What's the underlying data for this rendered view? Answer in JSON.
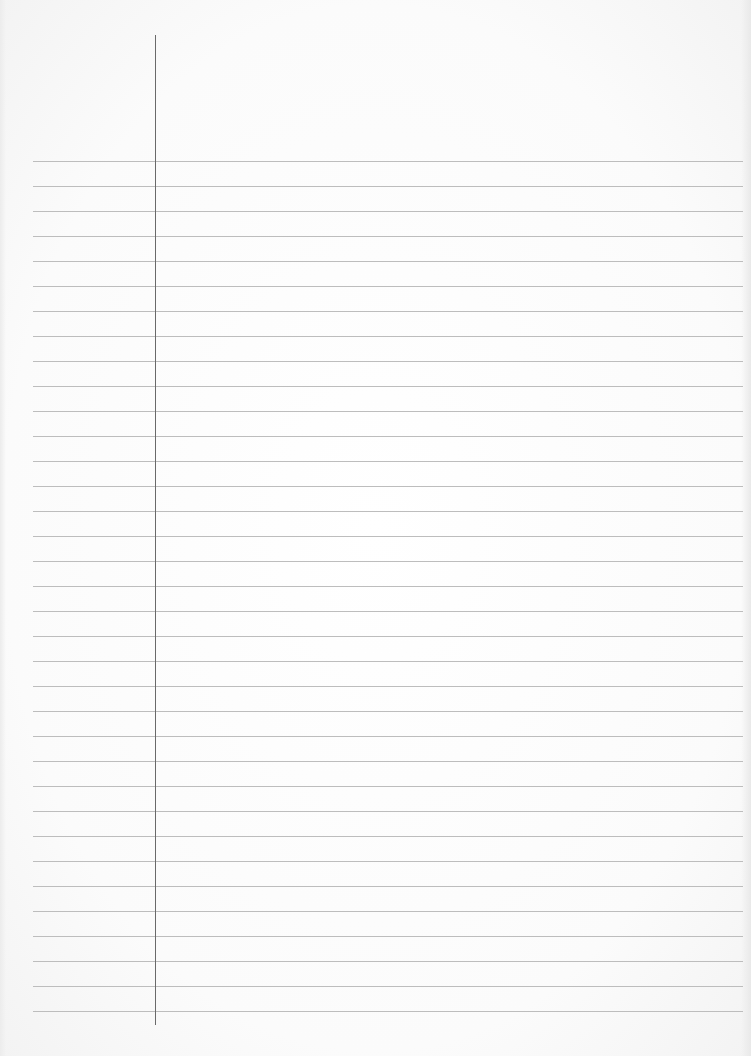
{
  "page": {
    "type": "ruled-notebook-page",
    "content_text": "",
    "background_color": "#fdfdfd",
    "rule_color": "#bdbdbd",
    "margin_line_color": "#6a6a6a",
    "rules": {
      "count": 35,
      "first_y": 161,
      "spacing": 25,
      "left_x": 33,
      "right_x": 743
    },
    "margin_line": {
      "x": 155,
      "top_y": 35,
      "bottom_y": 1025
    }
  }
}
